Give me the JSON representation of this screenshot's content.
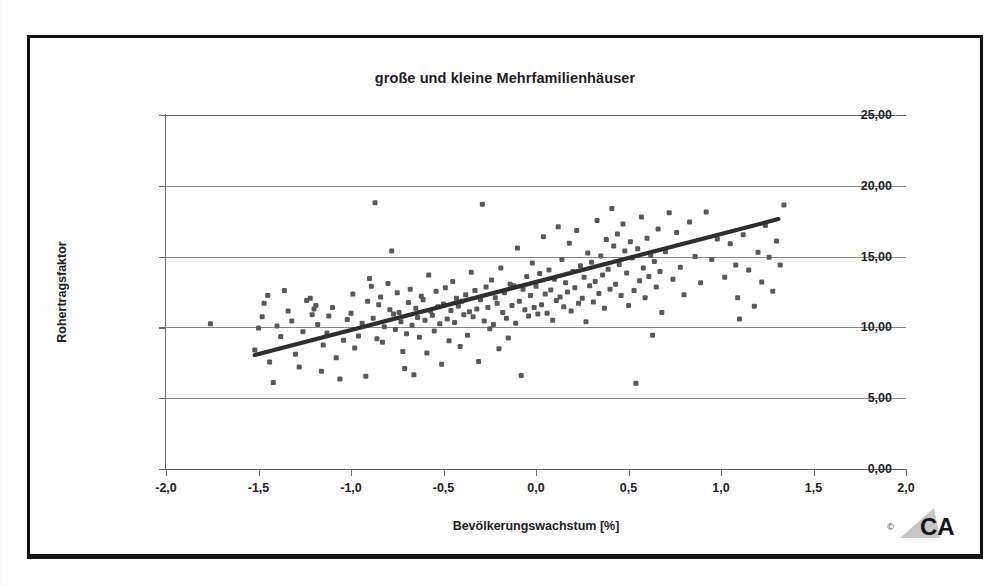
{
  "figure": {
    "title": "große und kleine Mehrfamilienhäuser",
    "logo_text": "CA",
    "copyright_mark": "©"
  },
  "chart_data": {
    "type": "scatter",
    "title": "große und kleine Mehrfamilienhäuser",
    "xlabel": "Bevölkerungswachstum [%]",
    "ylabel": "Rohertragsfaktor",
    "xlim": [
      -2.0,
      2.0
    ],
    "ylim": [
      0.0,
      25.0
    ],
    "grid": "horizontal",
    "legend": "none",
    "xticks": [
      -2.0,
      -1.5,
      -1.0,
      -0.5,
      0.0,
      0.5,
      1.0,
      1.5,
      2.0
    ],
    "xtick_labels": [
      "-2,0",
      "-1,5",
      "-1,0",
      "-0,5",
      "0,0",
      "0,5",
      "1,0",
      "1,5",
      "2,0"
    ],
    "yticks": [
      0,
      5,
      10,
      15,
      20,
      25
    ],
    "ytick_labels": [
      "0,00",
      "5,00",
      "10,00",
      "15,00",
      "20,00",
      "25,00"
    ],
    "marker_color": "#595959",
    "marker_shape": "square",
    "trendline": {
      "type": "linear",
      "color": "#2e2e2e",
      "x_start": -1.52,
      "y_start": 8.05,
      "x_end": 1.31,
      "y_end": 17.65,
      "slope": 3.39,
      "intercept": 13.2
    },
    "points": [
      [
        -1.76,
        10.25
      ],
      [
        -1.52,
        8.4
      ],
      [
        -1.5,
        9.95
      ],
      [
        -1.48,
        10.75
      ],
      [
        -1.47,
        11.7
      ],
      [
        -1.45,
        12.25
      ],
      [
        -1.44,
        7.55
      ],
      [
        -1.42,
        6.1
      ],
      [
        -1.4,
        10.1
      ],
      [
        -1.38,
        9.35
      ],
      [
        -1.36,
        12.6
      ],
      [
        -1.34,
        11.15
      ],
      [
        -1.32,
        10.45
      ],
      [
        -1.3,
        8.1
      ],
      [
        -1.28,
        7.2
      ],
      [
        -1.26,
        9.7
      ],
      [
        -1.24,
        11.9
      ],
      [
        -1.22,
        12.05
      ],
      [
        -1.21,
        10.9
      ],
      [
        -1.2,
        11.3
      ],
      [
        -1.19,
        11.55
      ],
      [
        -1.18,
        10.2
      ],
      [
        -1.16,
        6.9
      ],
      [
        -1.15,
        8.75
      ],
      [
        -1.13,
        9.6
      ],
      [
        -1.12,
        10.8
      ],
      [
        -1.1,
        11.4
      ],
      [
        -1.08,
        7.85
      ],
      [
        -1.06,
        6.35
      ],
      [
        -1.04,
        9.1
      ],
      [
        -1.02,
        10.55
      ],
      [
        -1.0,
        11.0
      ],
      [
        -0.99,
        12.35
      ],
      [
        -0.98,
        8.55
      ],
      [
        -0.96,
        9.4
      ],
      [
        -0.94,
        10.3
      ],
      [
        -0.92,
        6.55
      ],
      [
        -0.91,
        11.85
      ],
      [
        -0.9,
        13.45
      ],
      [
        -0.89,
        12.9
      ],
      [
        -0.88,
        10.65
      ],
      [
        -0.87,
        18.8
      ],
      [
        -0.86,
        9.2
      ],
      [
        -0.85,
        11.6
      ],
      [
        -0.84,
        12.15
      ],
      [
        -0.83,
        8.95
      ],
      [
        -0.82,
        10.05
      ],
      [
        -0.8,
        13.1
      ],
      [
        -0.79,
        11.25
      ],
      [
        -0.78,
        15.4
      ],
      [
        -0.77,
        10.95
      ],
      [
        -0.76,
        9.85
      ],
      [
        -0.75,
        12.45
      ],
      [
        -0.74,
        11.05
      ],
      [
        -0.73,
        10.4
      ],
      [
        -0.72,
        8.3
      ],
      [
        -0.71,
        7.1
      ],
      [
        -0.7,
        9.55
      ],
      [
        -0.69,
        11.75
      ],
      [
        -0.68,
        12.7
      ],
      [
        -0.67,
        10.15
      ],
      [
        -0.66,
        6.65
      ],
      [
        -0.65,
        11.35
      ],
      [
        -0.64,
        10.7
      ],
      [
        -0.63,
        9.3
      ],
      [
        -0.62,
        12.2
      ],
      [
        -0.61,
        11.95
      ],
      [
        -0.6,
        10.5
      ],
      [
        -0.59,
        8.2
      ],
      [
        -0.58,
        13.7
      ],
      [
        -0.57,
        11.15
      ],
      [
        -0.56,
        10.85
      ],
      [
        -0.55,
        9.75
      ],
      [
        -0.54,
        12.55
      ],
      [
        -0.53,
        11.45
      ],
      [
        -0.52,
        10.25
      ],
      [
        -0.51,
        7.4
      ],
      [
        -0.5,
        11.65
      ],
      [
        -0.49,
        12.8
      ],
      [
        -0.48,
        10.6
      ],
      [
        -0.47,
        9.05
      ],
      [
        -0.46,
        11.2
      ],
      [
        -0.45,
        13.25
      ],
      [
        -0.44,
        10.35
      ],
      [
        -0.43,
        12.05
      ],
      [
        -0.42,
        11.5
      ],
      [
        -0.41,
        8.65
      ],
      [
        -0.4,
        11.85
      ],
      [
        -0.39,
        10.9
      ],
      [
        -0.38,
        12.3
      ],
      [
        -0.37,
        9.45
      ],
      [
        -0.36,
        11.1
      ],
      [
        -0.35,
        13.9
      ],
      [
        -0.34,
        10.75
      ],
      [
        -0.33,
        12.6
      ],
      [
        -0.32,
        11.3
      ],
      [
        -0.31,
        7.6
      ],
      [
        -0.3,
        11.95
      ],
      [
        -0.29,
        18.7
      ],
      [
        -0.28,
        10.45
      ],
      [
        -0.27,
        12.85
      ],
      [
        -0.26,
        11.4
      ],
      [
        -0.25,
        9.9
      ],
      [
        -0.24,
        13.35
      ],
      [
        -0.23,
        10.2
      ],
      [
        -0.22,
        12.1
      ],
      [
        -0.21,
        11.7
      ],
      [
        -0.2,
        8.5
      ],
      [
        -0.19,
        14.2
      ],
      [
        -0.18,
        11.05
      ],
      [
        -0.17,
        12.45
      ],
      [
        -0.16,
        10.65
      ],
      [
        -0.15,
        9.25
      ],
      [
        -0.14,
        13.05
      ],
      [
        -0.13,
        11.55
      ],
      [
        -0.12,
        12.95
      ],
      [
        -0.11,
        10.3
      ],
      [
        -0.1,
        15.6
      ],
      [
        -0.09,
        11.85
      ],
      [
        -0.08,
        6.6
      ],
      [
        -0.07,
        12.7
      ],
      [
        -0.06,
        11.25
      ],
      [
        -0.05,
        13.6
      ],
      [
        -0.04,
        10.8
      ],
      [
        -0.03,
        12.25
      ],
      [
        -0.02,
        14.55
      ],
      [
        -0.01,
        11.4
      ],
      [
        0.0,
        12.9
      ],
      [
        0.01,
        10.95
      ],
      [
        0.02,
        13.8
      ],
      [
        0.03,
        11.6
      ],
      [
        0.04,
        16.4
      ],
      [
        0.05,
        12.35
      ],
      [
        0.06,
        11.0
      ],
      [
        0.07,
        14.05
      ],
      [
        0.08,
        12.65
      ],
      [
        0.09,
        10.5
      ],
      [
        0.1,
        13.4
      ],
      [
        0.11,
        11.9
      ],
      [
        0.12,
        17.1
      ],
      [
        0.13,
        12.15
      ],
      [
        0.14,
        14.8
      ],
      [
        0.15,
        11.45
      ],
      [
        0.16,
        13.15
      ],
      [
        0.17,
        12.5
      ],
      [
        0.18,
        15.95
      ],
      [
        0.19,
        11.15
      ],
      [
        0.2,
        13.95
      ],
      [
        0.21,
        12.8
      ],
      [
        0.22,
        16.85
      ],
      [
        0.23,
        11.7
      ],
      [
        0.24,
        14.35
      ],
      [
        0.25,
        12.05
      ],
      [
        0.26,
        13.55
      ],
      [
        0.27,
        10.4
      ],
      [
        0.28,
        15.25
      ],
      [
        0.29,
        12.95
      ],
      [
        0.3,
        14.6
      ],
      [
        0.31,
        11.8
      ],
      [
        0.32,
        13.25
      ],
      [
        0.33,
        17.55
      ],
      [
        0.34,
        12.4
      ],
      [
        0.35,
        15.05
      ],
      [
        0.36,
        13.7
      ],
      [
        0.37,
        11.35
      ],
      [
        0.38,
        16.2
      ],
      [
        0.39,
        14.1
      ],
      [
        0.4,
        12.7
      ],
      [
        0.41,
        18.4
      ],
      [
        0.42,
        15.75
      ],
      [
        0.43,
        13.05
      ],
      [
        0.44,
        16.6
      ],
      [
        0.45,
        14.45
      ],
      [
        0.46,
        12.25
      ],
      [
        0.47,
        17.3
      ],
      [
        0.48,
        15.4
      ],
      [
        0.49,
        13.85
      ],
      [
        0.5,
        11.55
      ],
      [
        0.51,
        16.05
      ],
      [
        0.52,
        14.9
      ],
      [
        0.53,
        12.6
      ],
      [
        0.54,
        6.05
      ],
      [
        0.55,
        15.55
      ],
      [
        0.56,
        13.3
      ],
      [
        0.57,
        17.8
      ],
      [
        0.58,
        14.2
      ],
      [
        0.59,
        12.1
      ],
      [
        0.6,
        16.3
      ],
      [
        0.61,
        13.6
      ],
      [
        0.62,
        15.1
      ],
      [
        0.63,
        9.45
      ],
      [
        0.64,
        14.65
      ],
      [
        0.65,
        12.85
      ],
      [
        0.66,
        16.95
      ],
      [
        0.67,
        13.95
      ],
      [
        0.68,
        11.05
      ],
      [
        0.7,
        15.35
      ],
      [
        0.72,
        18.1
      ],
      [
        0.74,
        13.4
      ],
      [
        0.76,
        16.7
      ],
      [
        0.78,
        14.25
      ],
      [
        0.8,
        12.3
      ],
      [
        0.83,
        17.45
      ],
      [
        0.86,
        15.0
      ],
      [
        0.89,
        13.15
      ],
      [
        0.92,
        18.15
      ],
      [
        0.95,
        14.8
      ],
      [
        0.98,
        16.25
      ],
      [
        1.02,
        13.55
      ],
      [
        1.05,
        15.9
      ],
      [
        1.08,
        14.4
      ],
      [
        1.09,
        12.1
      ],
      [
        1.1,
        10.6
      ],
      [
        1.12,
        16.55
      ],
      [
        1.15,
        14.05
      ],
      [
        1.18,
        11.5
      ],
      [
        1.2,
        15.3
      ],
      [
        1.22,
        13.2
      ],
      [
        1.24,
        17.2
      ],
      [
        1.26,
        14.95
      ],
      [
        1.28,
        12.55
      ],
      [
        1.3,
        16.1
      ],
      [
        1.32,
        14.4
      ],
      [
        1.34,
        18.65
      ]
    ]
  }
}
